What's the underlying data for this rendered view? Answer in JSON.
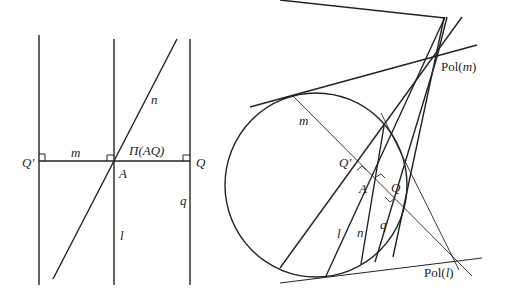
{
  "diagram": {
    "left_panel": {
      "labels": {
        "Q_prime": "Q'",
        "m": "m",
        "Pi_AQ": "Π(AQ)",
        "Q": "Q",
        "A": "A",
        "n": "n",
        "q": "q",
        "l": "l"
      }
    },
    "right_panel": {
      "labels": {
        "Pol_m": "Pol(m)",
        "Pol_m_prefix": "Pol(",
        "Pol_m_var": "m",
        "Pol_m_suffix": ")",
        "Pol_l_prefix": "Pol(",
        "Pol_l_var": "l",
        "Pol_l_suffix": ")",
        "m": "m",
        "Q_prime": "Q'",
        "A": "A",
        "Q": "Q",
        "l": "l",
        "n": "n",
        "q": "q"
      }
    },
    "colors": {
      "stroke": "#222222",
      "background": "#ffffff"
    }
  }
}
